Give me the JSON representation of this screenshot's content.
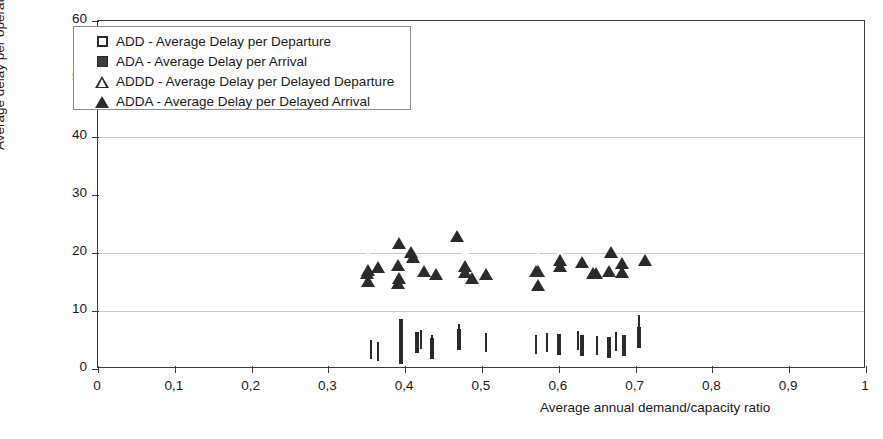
{
  "chart_data": {
    "type": "scatter",
    "title": "",
    "xlabel": "Average annual demand/capacity ratio",
    "ylabel": "Average delay per operation - minutes",
    "xlim": [
      0,
      1
    ],
    "ylim": [
      0,
      60
    ],
    "xticks": [
      "0",
      "0,1",
      "0,2",
      "0,3",
      "0,4",
      "0,5",
      "0,6",
      "0,7",
      "0,8",
      "0,9",
      "1"
    ],
    "xtick_values": [
      0,
      0.1,
      0.2,
      0.3,
      0.4,
      0.5,
      0.6,
      0.7,
      0.8,
      0.9,
      1
    ],
    "yticks": [
      "0",
      "10",
      "20",
      "30",
      "40",
      "50",
      "60"
    ],
    "ytick_values": [
      0,
      10,
      20,
      30,
      40,
      50,
      60
    ],
    "grid": "horizontal",
    "gridlines_at": [
      10,
      20,
      40
    ],
    "legend_position": "top-left",
    "series": [
      {
        "name": "ADD - Average Delay per Departure",
        "key": "ADD",
        "marker": "open-square",
        "points": [
          [
            0.395,
            6.8
          ],
          [
            0.395,
            5.2
          ],
          [
            0.395,
            2.6
          ],
          [
            0.415,
            4.4
          ],
          [
            0.435,
            3.5
          ],
          [
            0.47,
            5.0
          ],
          [
            0.6,
            4.2
          ],
          [
            0.63,
            3.9
          ],
          [
            0.665,
            3.6
          ],
          [
            0.685,
            4.0
          ],
          [
            0.705,
            5.4
          ]
        ]
      },
      {
        "name": "ADA - Average Delay per Arrival",
        "key": "ADA",
        "marker": "filled-square",
        "points": [
          [
            0.355,
            3.2
          ],
          [
            0.365,
            2.9
          ],
          [
            0.395,
            4.6
          ],
          [
            0.395,
            3.6
          ],
          [
            0.42,
            5.0
          ],
          [
            0.435,
            4.2
          ],
          [
            0.47,
            6.0
          ],
          [
            0.47,
            5.2
          ],
          [
            0.505,
            4.4
          ],
          [
            0.57,
            4.2
          ],
          [
            0.585,
            4.4
          ],
          [
            0.625,
            4.8
          ],
          [
            0.65,
            4.0
          ],
          [
            0.675,
            4.6
          ],
          [
            0.705,
            7.6
          ]
        ]
      },
      {
        "name": "ADDD - Average Delay per Delayed Departure",
        "key": "ADDD",
        "marker": "open-triangle",
        "points": [
          [
            0.352,
            19.6
          ],
          [
            0.392,
            24.3
          ],
          [
            0.392,
            18.2
          ],
          [
            0.407,
            22.8
          ],
          [
            0.478,
            20.4
          ],
          [
            0.487,
            18.2
          ],
          [
            0.573,
            19.5
          ],
          [
            0.602,
            20.4
          ],
          [
            0.645,
            19.2
          ],
          [
            0.665,
            19.4
          ],
          [
            0.682,
            19.3
          ]
        ]
      },
      {
        "name": "ADDA - Average Delay per Delayed Arrival",
        "key": "ADDA",
        "marker": "filled-triangle",
        "points": [
          [
            0.35,
            19.1
          ],
          [
            0.352,
            17.8
          ],
          [
            0.365,
            20.1
          ],
          [
            0.39,
            20.6
          ],
          [
            0.39,
            17.4
          ],
          [
            0.41,
            21.9
          ],
          [
            0.425,
            19.4
          ],
          [
            0.44,
            19.0
          ],
          [
            0.467,
            25.6
          ],
          [
            0.478,
            19.3
          ],
          [
            0.505,
            19.0
          ],
          [
            0.57,
            19.4
          ],
          [
            0.573,
            17.0
          ],
          [
            0.602,
            21.3
          ],
          [
            0.63,
            21.1
          ],
          [
            0.648,
            19.2
          ],
          [
            0.668,
            22.8
          ],
          [
            0.682,
            20.9
          ],
          [
            0.712,
            21.3
          ]
        ]
      }
    ]
  },
  "legend": {
    "items": [
      {
        "marker": "open-square",
        "label": "ADD - Average Delay per Departure"
      },
      {
        "marker": "filled-square",
        "label": "ADA - Average Delay per Arrival"
      },
      {
        "marker": "open-triangle",
        "label": "ADDD - Average Delay per Delayed Departure"
      },
      {
        "marker": "filled-triangle",
        "label": "ADDA - Average Delay per Delayed Arrival"
      }
    ]
  }
}
